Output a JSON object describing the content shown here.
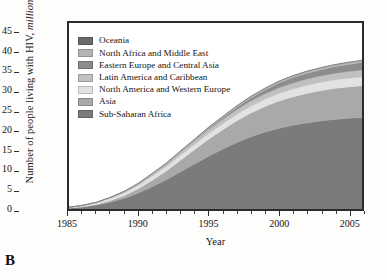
{
  "panel": {
    "letter": "B"
  },
  "chart_data": {
    "type": "area",
    "stacked": true,
    "title": "",
    "xlabel": "Year",
    "ylabel": "Number of people living with HIV, million",
    "ylabel_plain": "Number of people living with HIV,",
    "ylabel_italic": "million",
    "xlim": [
      1985,
      2006
    ],
    "ylim": [
      0,
      48
    ],
    "yticks": [
      0,
      5,
      10,
      15,
      20,
      25,
      30,
      35,
      40,
      45
    ],
    "xticks": [
      1985,
      1990,
      1995,
      2000,
      2005
    ],
    "xticks_minor": [
      1986,
      1987,
      1988,
      1989,
      1991,
      1992,
      1993,
      1994,
      1996,
      1997,
      1998,
      1999,
      2001,
      2002,
      2003,
      2004,
      2006
    ],
    "grid": false,
    "legend_position": "top-left",
    "x": [
      1985,
      1986,
      1987,
      1988,
      1989,
      1990,
      1991,
      1992,
      1993,
      1994,
      1995,
      1996,
      1997,
      1998,
      1999,
      2000,
      2001,
      2002,
      2003,
      2004,
      2005,
      2006
    ],
    "series": [
      {
        "name": "Sub-Saharan Africa",
        "color": "#7b7b7b",
        "values": [
          0.2,
          0.5,
          1.0,
          1.8,
          2.8,
          4.2,
          5.8,
          7.6,
          9.6,
          11.6,
          13.6,
          15.4,
          17.1,
          18.6,
          19.8,
          20.8,
          21.6,
          22.2,
          22.7,
          23.1,
          23.4,
          23.6
        ]
      },
      {
        "name": "Asia",
        "color": "#a9a9a9",
        "values": [
          0.05,
          0.1,
          0.2,
          0.4,
          0.7,
          1.1,
          1.7,
          2.3,
          3.0,
          3.7,
          4.4,
          5.0,
          5.6,
          6.1,
          6.6,
          7.0,
          7.3,
          7.6,
          7.8,
          8.0,
          8.1,
          8.2
        ]
      },
      {
        "name": "North America and Western Europe",
        "color": "#e2e2e2",
        "values": [
          0.15,
          0.25,
          0.4,
          0.55,
          0.7,
          0.85,
          1.0,
          1.1,
          1.25,
          1.35,
          1.45,
          1.55,
          1.65,
          1.75,
          1.85,
          1.95,
          2.0,
          2.1,
          2.15,
          2.2,
          2.25,
          2.3
        ]
      },
      {
        "name": "Latin America and Caribbean",
        "color": "#c0c0c0",
        "values": [
          0.05,
          0.1,
          0.15,
          0.25,
          0.35,
          0.45,
          0.6,
          0.7,
          0.85,
          0.95,
          1.05,
          1.15,
          1.25,
          1.35,
          1.4,
          1.5,
          1.55,
          1.6,
          1.65,
          1.7,
          1.75,
          1.8
        ]
      },
      {
        "name": "Eastern Europe and Central Asia",
        "color": "#8c8c8c",
        "values": [
          0.0,
          0.0,
          0.01,
          0.02,
          0.03,
          0.05,
          0.07,
          0.1,
          0.15,
          0.2,
          0.3,
          0.4,
          0.6,
          0.8,
          1.0,
          1.2,
          1.4,
          1.5,
          1.6,
          1.7,
          1.8,
          1.9
        ]
      },
      {
        "name": "North Africa and Middle East",
        "color": "#b4b4b4",
        "values": [
          0.0,
          0.01,
          0.02,
          0.03,
          0.05,
          0.07,
          0.1,
          0.13,
          0.17,
          0.21,
          0.25,
          0.29,
          0.33,
          0.37,
          0.4,
          0.43,
          0.45,
          0.47,
          0.49,
          0.5,
          0.51,
          0.52
        ]
      },
      {
        "name": "Oceania",
        "color": "#6a6a6a",
        "values": [
          0.0,
          0.0,
          0.01,
          0.01,
          0.02,
          0.02,
          0.03,
          0.03,
          0.04,
          0.04,
          0.05,
          0.05,
          0.06,
          0.06,
          0.07,
          0.07,
          0.07,
          0.08,
          0.08,
          0.08,
          0.09,
          0.09
        ]
      }
    ],
    "totals": [
      0.45,
      0.96,
      1.79,
      3.06,
      4.65,
      6.74,
      9.3,
      11.96,
      15.06,
      18.05,
      21.1,
      23.84,
      26.59,
      29.03,
      31.12,
      32.95,
      34.37,
      35.55,
      36.47,
      37.28,
      37.9,
      38.41
    ],
    "legend_order": [
      "Oceania",
      "North Africa and Middle East",
      "Eastern Europe and Central Asia",
      "Latin America and Caribbean",
      "North America and Western Europe",
      "Asia",
      "Sub-Saharan Africa"
    ]
  }
}
